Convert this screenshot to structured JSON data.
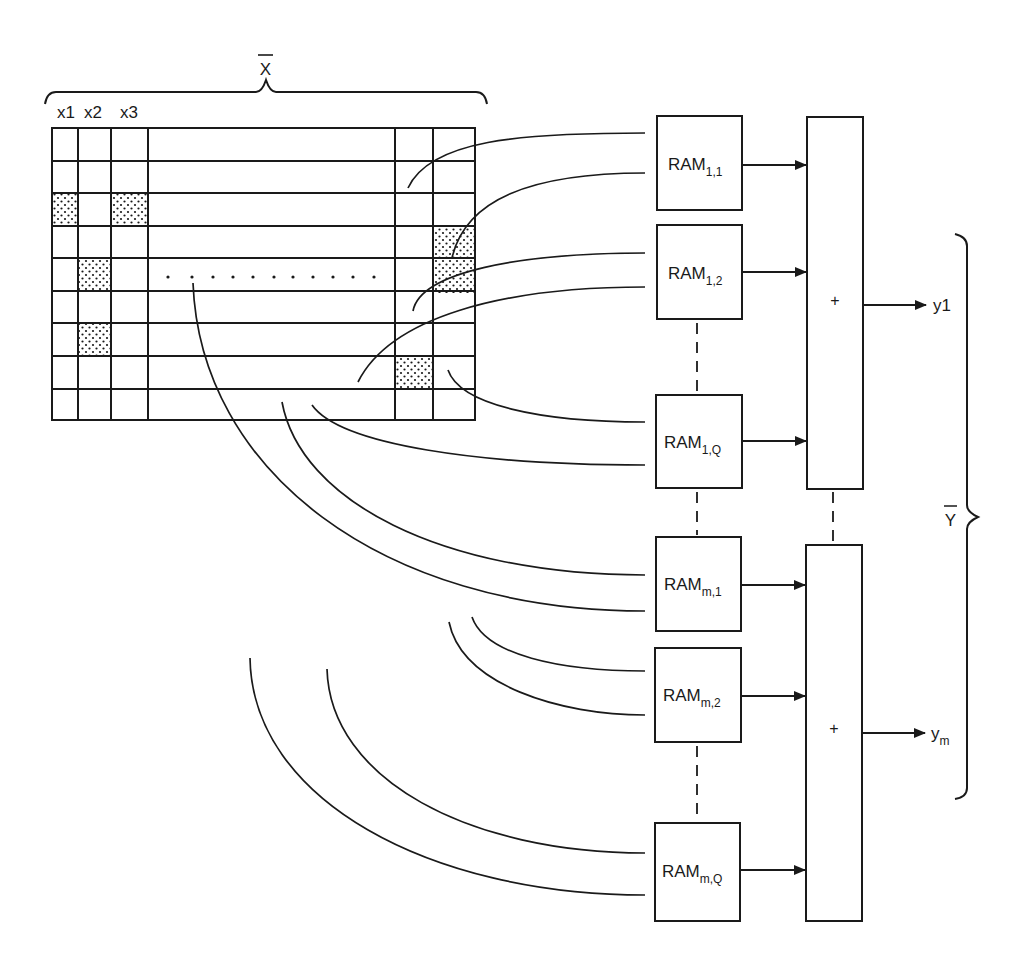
{
  "diagram": {
    "input_vector_label": "X",
    "output_vector_label": "Y",
    "column_labels": [
      "x1",
      "x2",
      "x3"
    ],
    "grid": {
      "rows": 9,
      "shaded_cells": [
        {
          "col": 1,
          "row": 3
        },
        {
          "col": 3,
          "row": 3
        },
        {
          "col": 2,
          "row": 5
        },
        {
          "col": 2,
          "row": 7
        },
        {
          "col": 6,
          "row": 4
        },
        {
          "col": 6,
          "row": 5
        },
        {
          "col": 5,
          "row": 8
        }
      ],
      "ellipsis_dots": 11
    },
    "discriminators": [
      {
        "adder_label": "+",
        "output_label": "y1",
        "output_main": "y",
        "output_sub": "1",
        "rams": [
          {
            "main": "RAM",
            "sub": "1,1"
          },
          {
            "main": "RAM",
            "sub": "1,2"
          },
          {
            "main": "RAM",
            "sub": "1,Q"
          }
        ]
      },
      {
        "adder_label": "+",
        "output_label": "ym",
        "output_main": "y",
        "output_sub": "m",
        "rams": [
          {
            "main": "RAM",
            "sub": "m,1"
          },
          {
            "main": "RAM",
            "sub": "m,2"
          },
          {
            "main": "RAM",
            "sub": "m,Q"
          }
        ]
      }
    ],
    "colors": {
      "line": "#1a1a1a",
      "background": "#ffffff"
    }
  }
}
